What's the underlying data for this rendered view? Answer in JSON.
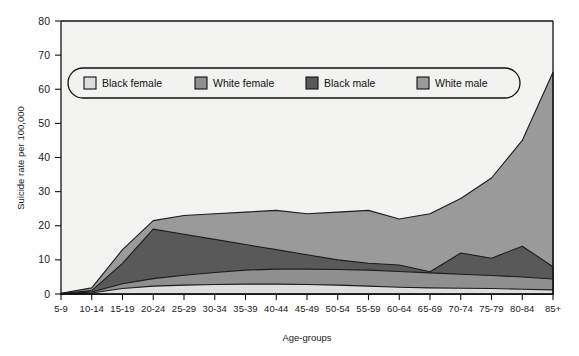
{
  "chart_data": {
    "type": "area",
    "title": "",
    "subtitle": "",
    "xlabel": "Age-groups",
    "ylabel": "Suicide rate per 100,000",
    "categories": [
      "5-9",
      "10-14",
      "15-19",
      "20-24",
      "25-29",
      "30-34",
      "35-39",
      "40-44",
      "45-49",
      "50-54",
      "55-59",
      "60-64",
      "65-69",
      "70-74",
      "75-79",
      "80-84",
      "85+"
    ],
    "ylim": [
      0,
      80
    ],
    "yticks": [
      0,
      10,
      20,
      30,
      40,
      50,
      60,
      70,
      80
    ],
    "grid": false,
    "legend_position": "top-inside",
    "overlap_mode": "layered",
    "series": [
      {
        "name": "White male",
        "color": "#9a9a9a",
        "values": [
          0.2,
          1.8,
          13.0,
          21.5,
          23.0,
          23.5,
          24.0,
          24.5,
          23.5,
          24.0,
          24.5,
          22.0,
          23.5,
          28.0,
          34.0,
          45.0,
          65.0
        ]
      },
      {
        "name": "Black male",
        "color": "#595959",
        "values": [
          0.1,
          1.0,
          9.0,
          19.0,
          17.5,
          16.0,
          14.5,
          13.0,
          11.5,
          10.0,
          9.0,
          8.5,
          6.5,
          12.0,
          10.5,
          14.0,
          8.0
        ]
      },
      {
        "name": "White female",
        "color": "#8f8f8f",
        "values": [
          0.1,
          0.6,
          3.0,
          4.5,
          5.5,
          6.3,
          7.0,
          7.3,
          7.3,
          7.2,
          7.0,
          6.6,
          6.2,
          5.8,
          5.4,
          5.0,
          4.4
        ]
      },
      {
        "name": "Black female",
        "color": "#dedede",
        "values": [
          0.05,
          0.3,
          1.6,
          2.3,
          2.6,
          2.8,
          2.9,
          2.9,
          2.8,
          2.6,
          2.3,
          2.0,
          1.8,
          1.7,
          1.6,
          1.4,
          1.2
        ]
      }
    ],
    "legend": [
      {
        "label": "Black female",
        "color": "#dedede"
      },
      {
        "label": "White female",
        "color": "#8f8f8f"
      },
      {
        "label": "Black male",
        "color": "#595959"
      },
      {
        "label": "White male",
        "color": "#9a9a9a"
      }
    ],
    "plot_background": "#f3f3f1"
  }
}
